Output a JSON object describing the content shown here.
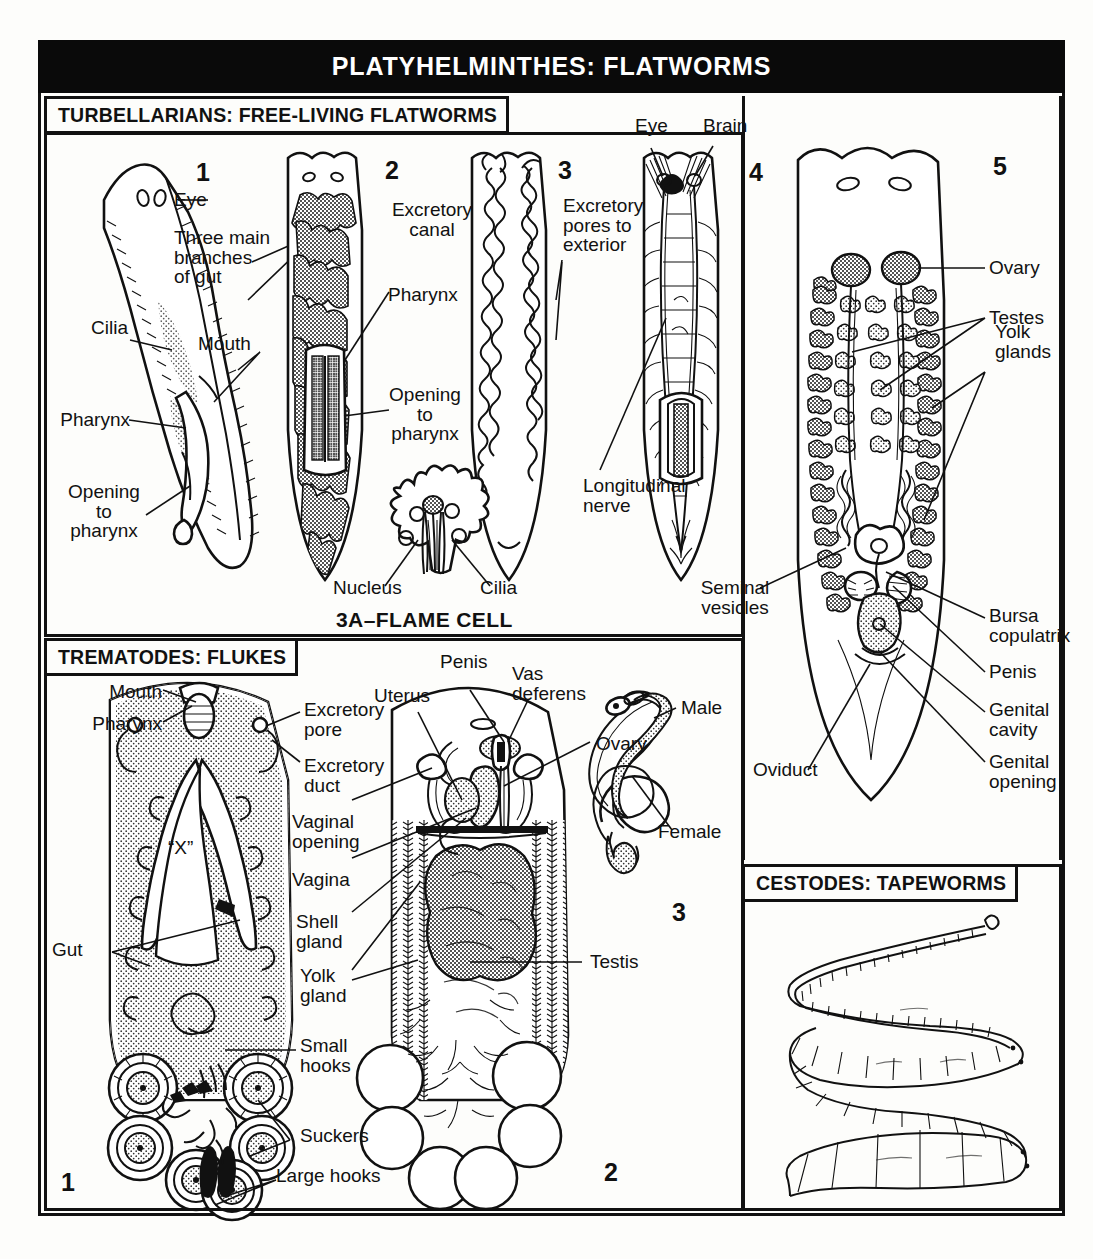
{
  "plate": {
    "title": "PLATYHELMINTHES:  FLATWORMS"
  },
  "sections": [
    {
      "id": "turbellarians",
      "header": "TURBELLARIANS: FREE-LIVING FLATWORMS"
    },
    {
      "id": "trematodes",
      "header": "TREMATODES: FLUKES"
    },
    {
      "id": "cestodes",
      "header": "CESTODES: TAPEWORMS"
    }
  ],
  "turbellarians": {
    "fig_numbers": [
      "1",
      "2",
      "3",
      "4",
      "5"
    ],
    "caption_flame_cell": "3A–FLAME CELL",
    "labels": {
      "eye1": "Eye",
      "three_main": "Three main\nbranches\nof gut",
      "cilia": "Cilia",
      "mouth": "Mouth",
      "pharynx_left": "Pharynx",
      "opening_left": "Opening\nto\npharynx",
      "excretory_canal": "Excretory\ncanal",
      "pharynx_mid": "Pharynx",
      "opening_mid": "Opening\nto\npharynx",
      "excretory_pores": "Excretory\npores to\nexterior",
      "nucleus": "Nucleus",
      "cilia_flame": "Cilia",
      "eye4": "Eye",
      "brain": "Brain",
      "longitudinal_nerve": "Longitudinal\nnerve",
      "ovary": "Ovary",
      "testes": "Testes",
      "yolk_glands": "Yolk\nglands",
      "seminal_vesicles": "Seminal\nvesicles",
      "bursa_copulatrix": "Bursa\ncopulatrix",
      "penis": "Penis",
      "genital_cavity": "Genital\ncavity",
      "genital_opening": "Genital\nopening",
      "oviduct": "Oviduct"
    }
  },
  "trematodes": {
    "fig_numbers": [
      "1",
      "2",
      "3"
    ],
    "labels": {
      "mouth": "Mouth",
      "pharynx": "Pharynx",
      "excretory_pore": "Excretory\npore",
      "excretory_duct": "Excretory\nduct",
      "x_mark": "“X”",
      "gut": "Gut",
      "small_hooks": "Small\nhooks",
      "suckers": "Suckers",
      "large_hooks": "Large hooks",
      "uterus": "Uterus",
      "penis": "Penis",
      "vas_deferens": "Vas\ndeferens",
      "ovary": "Ovary",
      "vaginal_opening": "Vaginal\nopening",
      "vagina": "Vagina",
      "shell_gland": "Shell\ngland",
      "yolk_gland": "Yolk\ngland",
      "testis": "Testis",
      "male": "Male",
      "female": "Female"
    }
  },
  "colors": {
    "ink": "#111111",
    "paper": "#fdfdfb",
    "banner_bg": "#0a0a0a",
    "banner_text": "#ffffff"
  }
}
